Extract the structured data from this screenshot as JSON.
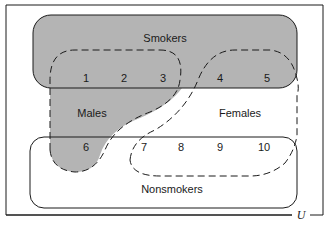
{
  "diagram": {
    "type": "venn",
    "universe_label": "U",
    "sets": [
      {
        "id": "smokers",
        "label": "Smokers",
        "fill": "#b4b4b4",
        "border": "solid"
      },
      {
        "id": "nonsmokers",
        "label": "Nonsmokers",
        "fill": "#ffffff",
        "border": "solid"
      },
      {
        "id": "males",
        "label": "Males",
        "fill": "#b4b4b4",
        "border": "dashed"
      },
      {
        "id": "females",
        "label": "Females",
        "fill": "#ffffff",
        "border": "dashed"
      }
    ],
    "elements": [
      "1",
      "2",
      "3",
      "4",
      "5",
      "6",
      "7",
      "8",
      "9",
      "10"
    ],
    "membership": {
      "smokers_males": [
        "1",
        "2",
        "3"
      ],
      "smokers_females": [
        "4",
        "5"
      ],
      "nonsmokers_males": [
        "6"
      ],
      "nonsmokers_females": [
        "7",
        "8",
        "9",
        "10"
      ]
    },
    "colors": {
      "shade": "#b4b4b4",
      "stroke": "#1a1a1a",
      "background": "#ffffff"
    }
  }
}
